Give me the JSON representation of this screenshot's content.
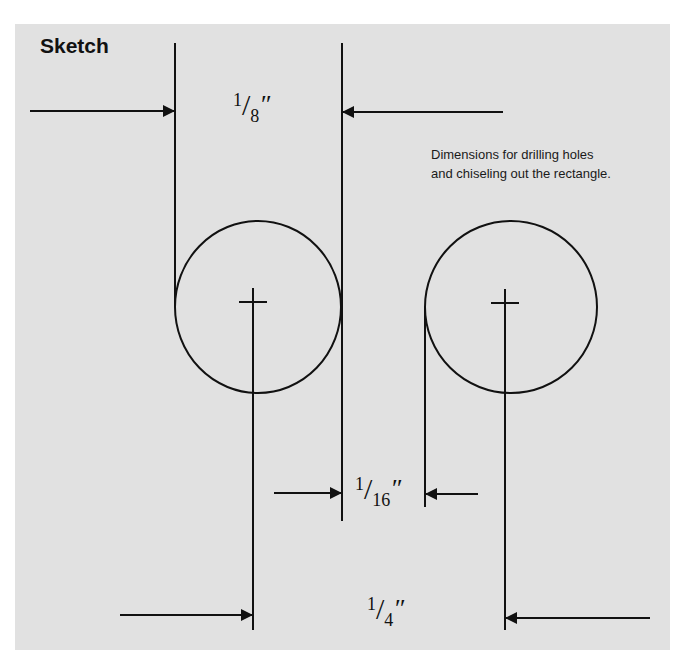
{
  "title": "Sketch",
  "caption": {
    "line1": "Dimensions for drilling holes",
    "line2": "and chiseling out the rectangle."
  },
  "dimensions": [
    {
      "id": "hole-diameter",
      "numerator": "1",
      "denominator": "8",
      "unit": "″"
    },
    {
      "id": "gap-between-holes",
      "numerator": "1",
      "denominator": "16",
      "unit": "″"
    },
    {
      "id": "center-to-center",
      "numerator": "1",
      "denominator": "4",
      "unit": "″"
    }
  ],
  "colors": {
    "panel": "#e1e1e1",
    "ink": "#111111"
  }
}
